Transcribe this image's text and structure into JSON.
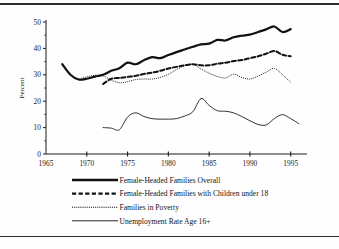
{
  "figure": {
    "background_color": "#fefefe",
    "frame_color": "#2b2b2b"
  },
  "chart_data": {
    "type": "line",
    "title": "",
    "xlabel": "",
    "ylabel": "Percent",
    "xlim": [
      1965,
      1997
    ],
    "ylim": [
      0,
      50
    ],
    "xticks": [
      1965,
      1970,
      1975,
      1980,
      1985,
      1990,
      1995
    ],
    "xticklabels": [
      "1965",
      "1970",
      "1975",
      "1980",
      "1985",
      "1990",
      "1995"
    ],
    "yticks": [
      0,
      10,
      20,
      30,
      40,
      50
    ],
    "yticklabels": [
      "0",
      "10",
      "20",
      "30",
      "40",
      "50"
    ],
    "yminorticks": [
      5,
      15,
      25,
      35,
      45
    ],
    "grid": false,
    "legend_position": "below",
    "series": [
      {
        "name": "Female-Headed Families Overall",
        "style": "solid-thick",
        "color": "#111111",
        "linewidth": 2.2,
        "x": [
          1967,
          1968,
          1969,
          1970,
          1971,
          1972,
          1973,
          1974,
          1975,
          1976,
          1977,
          1978,
          1979,
          1980,
          1981,
          1982,
          1983,
          1984,
          1985,
          1986,
          1987,
          1988,
          1989,
          1990,
          1991,
          1992,
          1993,
          1994,
          1995
        ],
        "values": [
          34.0,
          30.0,
          28.2,
          28.5,
          29.3,
          30.0,
          31.5,
          32.5,
          34.6,
          34.0,
          35.5,
          36.7,
          36.3,
          37.5,
          38.6,
          39.6,
          40.6,
          41.5,
          41.8,
          43.2,
          43.0,
          44.2,
          44.8,
          45.2,
          46.2,
          47.2,
          48.3,
          46.2,
          47.3
        ]
      },
      {
        "name": "Female-Headed Families with Children under 18",
        "style": "dashed-thick",
        "color": "#111111",
        "linewidth": 2.0,
        "x": [
          1972,
          1973,
          1974,
          1975,
          1976,
          1977,
          1978,
          1979,
          1980,
          1981,
          1982,
          1983,
          1984,
          1985,
          1986,
          1987,
          1988,
          1989,
          1990,
          1991,
          1992,
          1993,
          1994,
          1995
        ],
        "values": [
          26.5,
          28.5,
          28.8,
          29.2,
          29.6,
          30.3,
          30.8,
          31.5,
          32.4,
          33.0,
          33.6,
          34.0,
          33.6,
          33.6,
          34.2,
          34.6,
          35.2,
          35.6,
          36.3,
          37.0,
          38.0,
          39.0,
          37.6,
          37.0
        ]
      },
      {
        "name": "Families in Poverty",
        "style": "dotted-fine",
        "color": "#1a1a1a",
        "linewidth": 0.9,
        "x": [
          1969,
          1970,
          1971,
          1972,
          1973,
          1974,
          1975,
          1976,
          1977,
          1978,
          1979,
          1980,
          1981,
          1982,
          1983,
          1984,
          1985,
          1986,
          1987,
          1988,
          1989,
          1990,
          1991,
          1992,
          1993,
          1994,
          1995
        ],
        "values": [
          28.4,
          29.2,
          29.8,
          29.6,
          28.0,
          27.0,
          27.4,
          28.2,
          28.4,
          28.4,
          29.0,
          30.2,
          32.0,
          33.4,
          34.0,
          32.2,
          30.6,
          29.4,
          28.8,
          30.2,
          29.0,
          28.4,
          29.5,
          31.0,
          32.4,
          30.0,
          27.2
        ]
      },
      {
        "name": "Unemployment Rate Age 16+",
        "style": "solid-thin",
        "color": "#1a1a1a",
        "linewidth": 0.9,
        "x": [
          1972,
          1973,
          1974,
          1975,
          1976,
          1977,
          1978,
          1979,
          1980,
          1981,
          1982,
          1983,
          1984,
          1985,
          1986,
          1987,
          1988,
          1989,
          1990,
          1991,
          1992,
          1993,
          1994,
          1995,
          1996
        ],
        "values": [
          10.0,
          9.8,
          9.2,
          14.0,
          15.6,
          14.2,
          13.4,
          13.2,
          13.2,
          13.4,
          14.4,
          16.0,
          21.0,
          18.4,
          16.4,
          16.2,
          15.6,
          14.2,
          12.6,
          11.2,
          11.0,
          13.4,
          14.9,
          13.4,
          11.5
        ]
      }
    ]
  },
  "legend": {
    "items": [
      {
        "label": "Female-Headed Families Overall",
        "swatch": "solid-thick"
      },
      {
        "label": "Female-Headed Families with Children under 18",
        "swatch": "dashed-thick"
      },
      {
        "label": "Families in Poverty",
        "swatch": "dotted-fine"
      },
      {
        "label": "Unemployment Rate Age 16+",
        "swatch": "solid-thin"
      }
    ]
  }
}
